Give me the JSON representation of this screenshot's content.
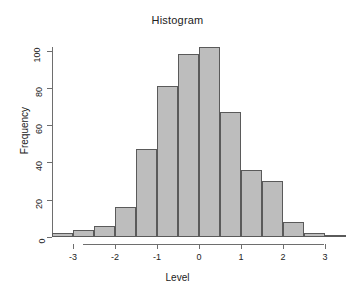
{
  "chart_data": {
    "type": "bar",
    "title": "Histogram",
    "xlabel": "Level",
    "ylabel": "Frequency",
    "grid": false,
    "legend": "none",
    "xlim": [
      -3.5,
      3.6
    ],
    "ylim": [
      0,
      102
    ],
    "bin_width": 0.5,
    "x_ticks": [
      -3,
      -2,
      -1,
      0,
      1,
      2,
      3
    ],
    "x_tick_labels": [
      "-3",
      "-2",
      "-1",
      "0",
      "1",
      "2",
      "3"
    ],
    "y_ticks": [
      0,
      20,
      40,
      60,
      80,
      100
    ],
    "y_tick_labels": [
      "0",
      "20",
      "40",
      "60",
      "80",
      "100"
    ],
    "bar_fill": "#bdbdbd",
    "bar_border": "#5a5a5a",
    "bins": [
      {
        "left": -3.5,
        "right": -3.0,
        "value": 2
      },
      {
        "left": -3.0,
        "right": -2.5,
        "value": 4
      },
      {
        "left": -2.5,
        "right": -2.0,
        "value": 6
      },
      {
        "left": -2.0,
        "right": -1.5,
        "value": 16
      },
      {
        "left": -1.5,
        "right": -1.0,
        "value": 47
      },
      {
        "left": -1.0,
        "right": -0.5,
        "value": 81
      },
      {
        "left": -0.5,
        "right": 0.0,
        "value": 98
      },
      {
        "left": 0.0,
        "right": 0.5,
        "value": 102
      },
      {
        "left": 0.5,
        "right": 1.0,
        "value": 67
      },
      {
        "left": 1.0,
        "right": 1.5,
        "value": 36
      },
      {
        "left": 1.5,
        "right": 2.0,
        "value": 30
      },
      {
        "left": 2.0,
        "right": 2.5,
        "value": 8
      },
      {
        "left": 2.5,
        "right": 3.0,
        "value": 2
      },
      {
        "left": 3.0,
        "right": 3.5,
        "value": 1
      }
    ],
    "categories": [
      "-3.5..-3",
      "-3..-2.5",
      "-2.5..-2",
      "-2..-1.5",
      "-1.5..-1",
      "-1..-0.5",
      "-0.5..0",
      "0..0.5",
      "0.5..1",
      "1..1.5",
      "1.5..2",
      "2..2.5",
      "2.5..3",
      "3..3.5"
    ],
    "values": [
      2,
      4,
      6,
      16,
      47,
      81,
      98,
      102,
      67,
      36,
      30,
      8,
      2,
      1
    ]
  }
}
